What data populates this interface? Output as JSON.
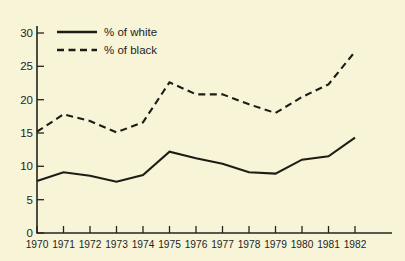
{
  "chart_data": {
    "type": "line",
    "title": "",
    "xlabel": "",
    "ylabel": "",
    "categories": [
      "1970",
      "1971",
      "1972",
      "1973",
      "1974",
      "1975",
      "1976",
      "1977",
      "1978",
      "1979",
      "1980",
      "1981",
      "1982"
    ],
    "x": [
      1970,
      1971,
      1972,
      1973,
      1974,
      1975,
      1976,
      1977,
      1978,
      1979,
      1980,
      1981,
      1982
    ],
    "series": [
      {
        "name": "% of white",
        "style": "solid",
        "color": "#1d1d16",
        "values": [
          7.8,
          9.1,
          8.6,
          7.7,
          8.7,
          12.2,
          11.2,
          10.4,
          9.1,
          8.9,
          11.0,
          11.5,
          14.3
        ]
      },
      {
        "name": "% of black",
        "style": "dashed",
        "color": "#1d1d16",
        "values": [
          15.2,
          17.8,
          16.8,
          15.1,
          16.6,
          22.6,
          20.8,
          20.8,
          19.3,
          18.0,
          20.4,
          22.3,
          27.2
        ]
      }
    ],
    "ylim": [
      0,
      32
    ],
    "yticks": [
      0,
      5,
      10,
      15,
      20,
      25,
      30
    ],
    "ytick_labels": [
      "0",
      "5",
      "10",
      "15",
      "20",
      "25",
      "30"
    ],
    "xtick_labels": [
      "1970",
      "1971",
      "1972",
      "1973",
      "1974",
      "1975",
      "1976",
      "1977",
      "1978",
      "1979",
      "1980",
      "1981",
      "1982"
    ],
    "grid": false,
    "legend_position": "top-left",
    "legend": [
      {
        "label": "% of white",
        "style": "solid"
      },
      {
        "label": "% of black",
        "style": "dashed"
      }
    ],
    "background_color": "#f7f4d8",
    "axis_color": "#24241c"
  }
}
